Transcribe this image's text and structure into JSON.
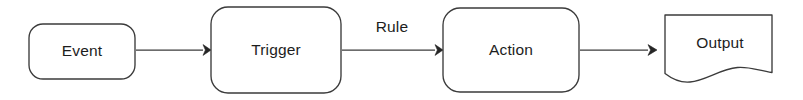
{
  "diagram": {
    "type": "flowchart",
    "orientation": "left-to-right",
    "canvas": {
      "width": 803,
      "height": 100
    },
    "colors": {
      "stroke": "#3b3b3b",
      "fill": "#ffffff",
      "text": "#1d1d1d",
      "arrow": "#252525",
      "background": "#ffffff"
    },
    "nodes": [
      {
        "id": "event",
        "label": "Event",
        "shape": "rounded-rectangle",
        "x": 29,
        "y": 24,
        "width": 106,
        "height": 55,
        "radius": 14,
        "label_x": 82,
        "label_y": 51.5
      },
      {
        "id": "trigger",
        "label": "Trigger",
        "shape": "rounded-rectangle",
        "x": 211,
        "y": 7,
        "width": 130,
        "height": 86,
        "radius": 17,
        "label_x": 276,
        "label_y": 50
      },
      {
        "id": "action",
        "label": "Action",
        "shape": "rounded-rectangle",
        "x": 443,
        "y": 8,
        "width": 136,
        "height": 84,
        "radius": 17,
        "label_x": 511,
        "label_y": 50
      },
      {
        "id": "output",
        "label": "Output",
        "shape": "document",
        "x": 665,
        "y": 15,
        "width": 107,
        "height": 68,
        "label_x": 720,
        "label_y": 44
      }
    ],
    "edges": [
      {
        "id": "event-to-trigger",
        "from": "event",
        "to": "trigger",
        "label": "",
        "x1": 136,
        "y1": 50,
        "x2": 210,
        "y2": 50
      },
      {
        "id": "trigger-to-action",
        "from": "trigger",
        "to": "action",
        "label": "Rule",
        "x1": 342,
        "y1": 50,
        "x2": 442,
        "y2": 50,
        "label_x": 392,
        "label_y": 28
      },
      {
        "id": "action-to-output",
        "from": "action",
        "to": "output",
        "label": "",
        "x1": 580,
        "y1": 50,
        "x2": 664,
        "y2": 50
      }
    ]
  }
}
